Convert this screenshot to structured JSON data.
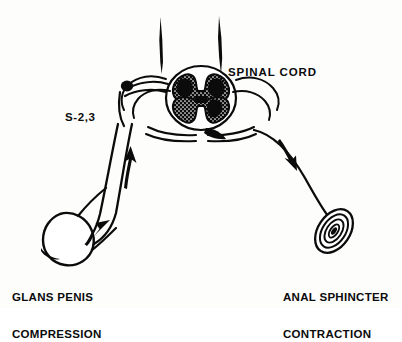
{
  "figure": {
    "background_color": "#fdfdfc",
    "ink_color": "#0b0b0b",
    "width": 402,
    "height": 308
  },
  "labels": {
    "spinal_cord": "SPINAL CORD",
    "segment": "S-2,3",
    "glans_line1": "GLANS PENIS",
    "glans_line2": "COMPRESSION",
    "anal_line1": "ANAL SPHINCTER",
    "anal_line2": "CONTRACTION"
  },
  "parts": {
    "spinal_cord_section": "spinal-cord-cross-section",
    "gray_matter": "butterfly-gray-matter",
    "dorsal_root_ganglion": "dorsal-root-ganglion",
    "afferent_nerve": "afferent-sensory-nerve",
    "efferent_nerve": "efferent-motor-nerve",
    "glans_penis": "glans-penis",
    "anal_sphincter": "anal-sphincter",
    "afferent_arrow_direction": "up",
    "efferent_arrow_direction": "down",
    "stimulus_arrow_direction": "into-glans"
  }
}
